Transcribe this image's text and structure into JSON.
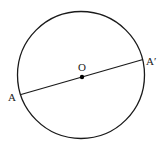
{
  "diagram": {
    "type": "circle-with-diameter",
    "center_label": "O",
    "endpoint_labels": {
      "start": "A",
      "end": "A′"
    },
    "stroke_color": "#1a1a1a",
    "center_point_color": "#000000"
  }
}
